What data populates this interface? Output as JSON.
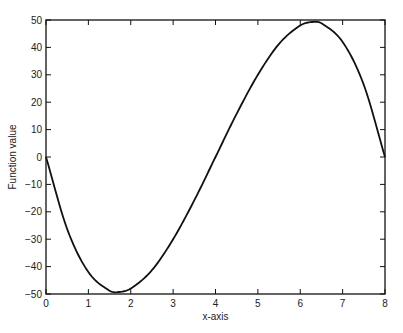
{
  "chart_data": {
    "type": "line",
    "title": "",
    "xlabel": "x-axis",
    "ylabel": "Function value",
    "xlim": [
      0,
      8
    ],
    "ylim": [
      -50,
      50
    ],
    "xticks": [
      "0",
      "1",
      "2",
      "3",
      "4",
      "5",
      "6",
      "7",
      "8"
    ],
    "yticks": [
      "-50",
      "-40",
      "-30",
      "-20",
      "-10",
      "0",
      "10",
      "20",
      "30",
      "40",
      "50"
    ],
    "grid": false,
    "legend": null,
    "series": [
      {
        "name": "f(x)",
        "x": [
          0,
          0.5,
          1,
          1.5,
          1.7,
          2,
          2.5,
          3,
          3.5,
          4,
          4.5,
          5,
          5.5,
          6,
          6.3,
          6.5,
          7,
          7.5,
          8
        ],
        "values": [
          0,
          -26.3,
          -42,
          -48.8,
          -49.3,
          -48,
          -41.3,
          -30,
          -15.8,
          0,
          15.8,
          30,
          41.3,
          48,
          49.3,
          48.8,
          42,
          26.3,
          0
        ]
      }
    ],
    "line_color": "#111111"
  }
}
